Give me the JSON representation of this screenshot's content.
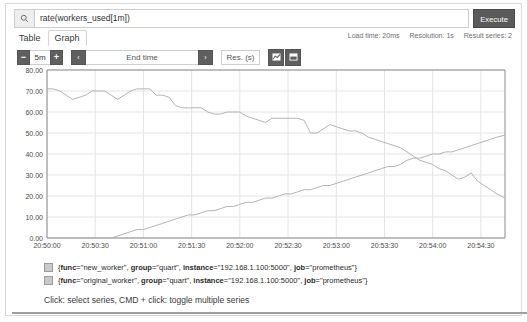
{
  "query": {
    "value": "rate(workers_used[1m])",
    "placeholder": "Expression (press Shift+Enter for newlines)",
    "search_icon": "search-icon",
    "execute_label": "Execute"
  },
  "tabs": [
    {
      "label": "Table",
      "active": false
    },
    {
      "label": "Graph",
      "active": true
    }
  ],
  "stats": {
    "load_time": "Load time: 20ms",
    "resolution": "Resolution: 1s",
    "result_series": "Result series: 2"
  },
  "controls": {
    "decrease_label": "−",
    "range_value": "5m",
    "increase_label": "+",
    "prev_label": "‹",
    "end_time_label": "End time",
    "next_label": "›",
    "resolution_label": "Res. (s)",
    "line_chart_icon": "line-chart-icon",
    "stacked_chart_icon": "stacked-chart-icon"
  },
  "legend": {
    "items": [
      {
        "swatch_color": "#c9c9c9",
        "parts": [
          {
            "k": "func",
            "v": "new_worker"
          },
          {
            "k": "group",
            "v": "quart"
          },
          {
            "k": "instance",
            "v": "192.168.1.100:5000"
          },
          {
            "k": "job",
            "v": "prometheus"
          }
        ]
      },
      {
        "swatch_color": "#c9c9c9",
        "parts": [
          {
            "k": "func",
            "v": "original_worker"
          },
          {
            "k": "group",
            "v": "quart"
          },
          {
            "k": "instance",
            "v": "192.168.1.100:5000"
          },
          {
            "k": "job",
            "v": "prometheus"
          }
        ]
      }
    ],
    "hint": "Click: select series, CMD + click: toggle multiple series"
  },
  "chart_data": {
    "type": "line",
    "title": "",
    "xlabel": "",
    "ylabel": "",
    "grid": true,
    "legend_position": "bottom",
    "ylim": [
      0,
      80
    ],
    "yticks": [
      "0.00",
      "10.00",
      "20.00",
      "30.00",
      "40.00",
      "50.00",
      "60.00",
      "70.00",
      "80.00"
    ],
    "ytick_values": [
      0,
      10,
      20,
      30,
      40,
      50,
      60,
      70,
      80
    ],
    "xticks": [
      "20:50:00",
      "20:50:30",
      "20:51:00",
      "20:51:30",
      "20:52:00",
      "20:52:30",
      "20:53:00",
      "20:53:30",
      "20:54:00",
      "20:54:30"
    ],
    "xtick_values": [
      0,
      30,
      60,
      90,
      120,
      150,
      180,
      210,
      240,
      270
    ],
    "xlim": [
      0,
      285
    ],
    "series": [
      {
        "name": "original_worker",
        "color": "#b4b4b4",
        "x": [
          0,
          4,
          8,
          12,
          16,
          20,
          24,
          28,
          32,
          36,
          40,
          44,
          48,
          52,
          56,
          60,
          64,
          68,
          72,
          76,
          80,
          84,
          88,
          92,
          96,
          100,
          104,
          108,
          112,
          116,
          120,
          124,
          128,
          132,
          136,
          140,
          144,
          148,
          152,
          156,
          160,
          164,
          168,
          172,
          176,
          180,
          184,
          188,
          192,
          196,
          200,
          204,
          208,
          212,
          216,
          220,
          224,
          228,
          232,
          236,
          240,
          244,
          248,
          252,
          256,
          260,
          264,
          268,
          272,
          276,
          280,
          285
        ],
        "values": [
          71,
          71,
          70,
          68,
          66,
          67,
          68,
          70,
          70,
          70,
          68,
          66,
          68,
          70,
          71,
          71,
          71,
          68,
          68,
          67,
          63,
          62,
          62,
          62,
          62,
          60,
          59,
          59,
          60,
          60,
          60,
          58,
          57,
          56,
          55,
          57,
          57,
          57,
          57,
          57,
          56,
          50,
          50,
          52,
          54,
          53,
          52,
          51,
          51,
          50,
          48,
          47,
          46,
          45,
          44,
          43,
          41,
          39,
          37,
          36,
          35,
          33,
          32,
          30,
          28,
          29,
          31,
          27,
          25,
          23,
          21,
          19
        ]
      },
      {
        "name": "new_worker",
        "color": "#b4b4b4",
        "x": [
          0,
          4,
          8,
          12,
          16,
          20,
          24,
          28,
          32,
          36,
          40,
          44,
          48,
          52,
          56,
          60,
          64,
          68,
          72,
          76,
          80,
          84,
          88,
          92,
          96,
          100,
          104,
          108,
          112,
          116,
          120,
          124,
          128,
          132,
          136,
          140,
          144,
          148,
          152,
          156,
          160,
          164,
          168,
          172,
          176,
          180,
          184,
          188,
          192,
          196,
          200,
          204,
          208,
          212,
          216,
          220,
          224,
          228,
          232,
          236,
          240,
          244,
          248,
          252,
          256,
          260,
          264,
          268,
          272,
          276,
          280,
          285
        ],
        "values": [
          0,
          0,
          0,
          0,
          0,
          0,
          0,
          0,
          0,
          0,
          0,
          1,
          2,
          3,
          4,
          4,
          5,
          6,
          7,
          8,
          9,
          10,
          11,
          11,
          12,
          13,
          13,
          14,
          15,
          15,
          16,
          17,
          17,
          18,
          19,
          19,
          20,
          21,
          21,
          22,
          23,
          23,
          24,
          25,
          25,
          26,
          27,
          28,
          29,
          30,
          31,
          32,
          33,
          34,
          34,
          35,
          37,
          38,
          38,
          39,
          40,
          40,
          41,
          41,
          42,
          43,
          44,
          45,
          46,
          47,
          48,
          49
        ]
      }
    ]
  }
}
